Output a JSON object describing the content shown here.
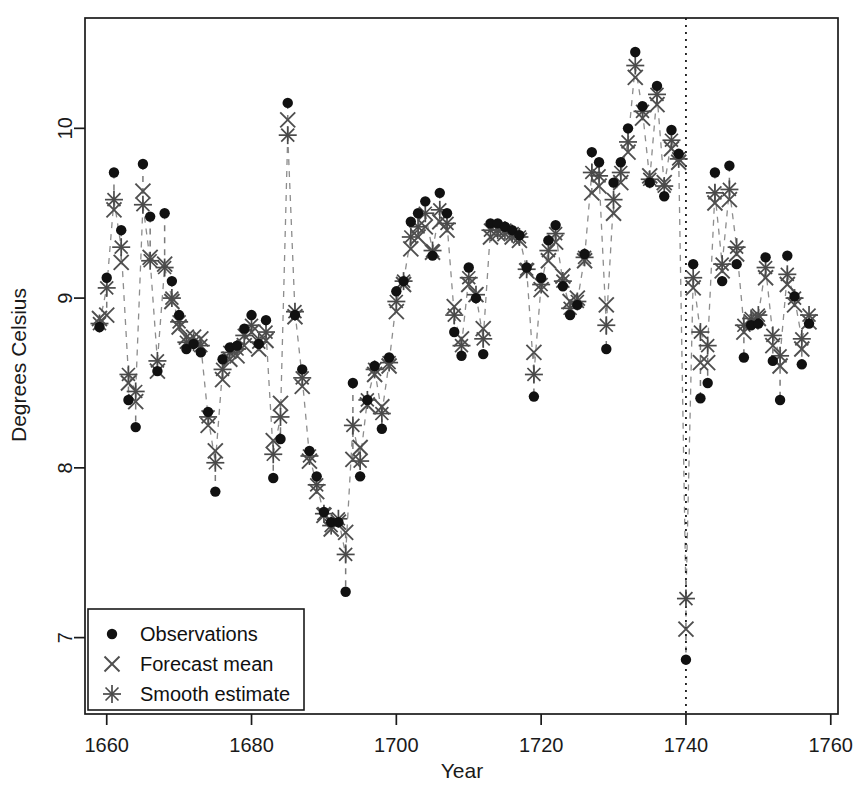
{
  "chart_data": {
    "type": "scatter",
    "title": "",
    "xlabel": "Year",
    "ylabel": "Degrees Celsius",
    "xlim": [
      1657,
      1761
    ],
    "ylim": [
      6.55,
      10.65
    ],
    "xticks": [
      1660,
      1680,
      1700,
      1720,
      1740,
      1760
    ],
    "yticks": [
      7,
      8,
      9,
      10
    ],
    "grid": false,
    "legend_position": "bottom-left",
    "annotations": [
      {
        "type": "vline",
        "x": 1740,
        "style": "dotted",
        "label": "forecast-origin"
      }
    ],
    "legend": [
      {
        "name": "Observations",
        "marker": "filled-circle"
      },
      {
        "name": "Forecast mean",
        "marker": "cross"
      },
      {
        "name": "Smooth estimate",
        "marker": "asterisk"
      }
    ],
    "x": [
      1659,
      1660,
      1661,
      1662,
      1663,
      1664,
      1665,
      1666,
      1667,
      1668,
      1669,
      1670,
      1671,
      1672,
      1673,
      1674,
      1675,
      1676,
      1677,
      1678,
      1679,
      1680,
      1681,
      1682,
      1683,
      1684,
      1685,
      1686,
      1687,
      1688,
      1689,
      1690,
      1691,
      1692,
      1693,
      1694,
      1695,
      1696,
      1697,
      1698,
      1699,
      1700,
      1701,
      1702,
      1703,
      1704,
      1705,
      1706,
      1707,
      1708,
      1709,
      1710,
      1711,
      1712,
      1713,
      1714,
      1715,
      1716,
      1717,
      1718,
      1719,
      1720,
      1721,
      1722,
      1723,
      1724,
      1725,
      1726,
      1727,
      1728,
      1729,
      1730,
      1731,
      1732,
      1733,
      1734,
      1735,
      1736,
      1737,
      1738,
      1739,
      1740,
      1741,
      1742,
      1743,
      1744,
      1745,
      1746,
      1747,
      1748,
      1749,
      1750,
      1751,
      1752,
      1753,
      1754,
      1755,
      1756,
      1757
    ],
    "series": [
      {
        "name": "Observations",
        "marker": "filled-circle",
        "values": [
          8.83,
          9.12,
          9.74,
          9.4,
          8.4,
          8.24,
          9.79,
          9.48,
          8.57,
          9.5,
          9.1,
          8.9,
          8.7,
          8.73,
          8.68,
          8.33,
          7.86,
          8.64,
          8.71,
          8.72,
          8.82,
          8.9,
          8.73,
          8.87,
          7.94,
          8.17,
          10.15,
          8.9,
          8.58,
          8.1,
          7.95,
          7.74,
          7.68,
          7.68,
          7.27,
          8.5,
          7.95,
          8.4,
          8.6,
          8.23,
          8.65,
          9.04,
          9.1,
          9.45,
          9.5,
          9.57,
          9.25,
          9.62,
          9.5,
          8.8,
          8.66,
          9.18,
          9.0,
          8.67,
          9.44,
          9.44,
          9.42,
          9.4,
          9.37,
          9.18,
          8.42,
          9.12,
          9.34,
          9.43,
          9.07,
          8.9,
          8.96,
          9.26,
          9.86,
          9.8,
          8.7,
          9.68,
          9.8,
          10.0,
          10.45,
          10.13,
          9.68,
          10.25,
          9.6,
          9.99,
          9.85,
          6.87,
          9.2,
          8.41,
          8.5,
          9.74,
          9.1,
          9.78,
          9.2,
          8.65,
          8.84,
          8.85,
          9.24,
          8.63,
          8.4,
          9.25,
          9.01,
          8.61,
          8.85
        ]
      },
      {
        "name": "Forecast mean",
        "marker": "cross",
        "values": [
          8.88,
          8.9,
          9.52,
          9.21,
          8.5,
          8.39,
          9.63,
          9.24,
          8.57,
          9.2,
          8.98,
          8.83,
          8.77,
          8.77,
          8.76,
          8.25,
          8.1,
          8.52,
          8.64,
          8.66,
          8.72,
          8.8,
          8.7,
          8.75,
          8.16,
          8.38,
          10.05,
          8.89,
          8.48,
          8.04,
          7.86,
          7.72,
          7.64,
          7.68,
          7.62,
          8.05,
          8.12,
          8.37,
          8.55,
          8.36,
          8.6,
          8.92,
          9.08,
          9.29,
          9.36,
          9.42,
          9.27,
          9.45,
          9.4,
          8.95,
          8.76,
          9.08,
          9.02,
          8.82,
          9.36,
          9.38,
          9.38,
          9.36,
          9.34,
          9.16,
          8.68,
          9.05,
          9.22,
          9.33,
          9.13,
          8.98,
          9.0,
          9.22,
          9.62,
          9.66,
          8.96,
          9.5,
          9.68,
          9.86,
          10.3,
          10.06,
          9.72,
          10.14,
          9.68,
          9.88,
          9.8,
          7.05,
          9.06,
          8.62,
          8.62,
          9.56,
          9.16,
          9.58,
          9.26,
          8.8,
          8.86,
          8.88,
          9.12,
          8.72,
          8.6,
          9.08,
          8.96,
          8.7,
          8.86
        ]
      },
      {
        "name": "Smooth estimate",
        "marker": "asterisk",
        "values": [
          8.85,
          9.06,
          9.58,
          9.3,
          8.55,
          8.45,
          9.55,
          9.22,
          8.63,
          9.18,
          9.0,
          8.86,
          8.74,
          8.74,
          8.72,
          8.3,
          8.03,
          8.58,
          8.68,
          8.7,
          8.78,
          8.84,
          8.74,
          8.8,
          8.08,
          8.3,
          9.96,
          8.92,
          8.53,
          8.07,
          7.9,
          7.73,
          7.66,
          7.7,
          7.49,
          8.25,
          8.04,
          8.4,
          8.58,
          8.32,
          8.62,
          8.98,
          9.1,
          9.36,
          9.42,
          9.5,
          9.28,
          9.52,
          9.44,
          8.9,
          8.72,
          9.12,
          9.02,
          8.76,
          9.4,
          9.4,
          9.4,
          9.38,
          9.36,
          9.17,
          8.55,
          9.08,
          9.28,
          9.38,
          9.1,
          8.94,
          8.98,
          9.24,
          9.74,
          9.72,
          8.84,
          9.58,
          9.74,
          9.92,
          10.37,
          10.1,
          9.7,
          10.2,
          9.66,
          9.93,
          9.82,
          7.23,
          9.12,
          8.8,
          8.72,
          9.62,
          9.2,
          9.64,
          9.3,
          8.84,
          8.88,
          8.9,
          9.18,
          8.78,
          8.66,
          9.14,
          9.0,
          8.76,
          8.9
        ]
      }
    ]
  },
  "axes": {
    "x_label": "Year",
    "y_label": "Degrees Celsius",
    "x_ticks": [
      "1660",
      "1680",
      "1700",
      "1720",
      "1740",
      "1760"
    ],
    "y_ticks": [
      "7",
      "8",
      "9",
      "10"
    ]
  },
  "legend": {
    "items": [
      {
        "label": "Observations",
        "marker": "filled-circle"
      },
      {
        "label": "Forecast mean",
        "marker": "cross"
      },
      {
        "label": "Smooth estimate",
        "marker": "asterisk"
      }
    ]
  },
  "colors": {
    "axis": "#1a1a1a",
    "observations": "#111111",
    "forecast_mean": "#4f4f4f",
    "smooth_estimate": "#4a4a4a",
    "connector": "#7a7a7a",
    "background": "#ffffff"
  }
}
